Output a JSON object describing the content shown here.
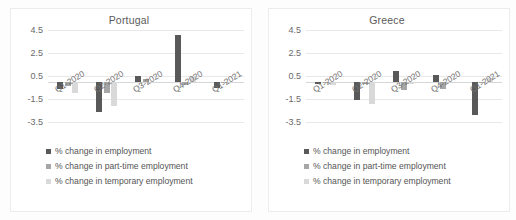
{
  "chart_data": [
    {
      "type": "bar",
      "title": "Portugal",
      "xlabel": "",
      "ylabel": "",
      "ylim": [
        -3.5,
        4.5
      ],
      "yticks": [
        4.5,
        2.5,
        0.5,
        -1.5,
        -3.5
      ],
      "ytick_labels": [
        "4.5",
        "2.5",
        "0.5",
        "-1.5",
        "-3.5"
      ],
      "grid": true,
      "legend_position": "below",
      "categories": [
        "Q1-2020",
        "Q2-2020",
        "Q3-2020",
        "Q4-2020",
        "Q1-2021"
      ],
      "series": [
        {
          "name": "% change in employment",
          "color": "#595959",
          "values": [
            -0.6,
            -2.6,
            0.5,
            4.1,
            -0.5
          ]
        },
        {
          "name": "% change in part-time employment",
          "color": "#a6a6a6",
          "values": [
            -0.4,
            -1.0,
            0.2,
            -0.3,
            -0.05
          ]
        },
        {
          "name": "% change in temporary employment",
          "color": "#d9d9d9",
          "values": [
            -1.0,
            -2.1,
            -0.05,
            0.5,
            0.0
          ]
        }
      ]
    },
    {
      "type": "bar",
      "title": "Greece",
      "xlabel": "",
      "ylabel": "",
      "ylim": [
        -3.5,
        4.5
      ],
      "yticks": [
        4.5,
        2.5,
        0.5,
        -1.5,
        -3.5
      ],
      "ytick_labels": [
        "4.5",
        "2.5",
        "0.5",
        "-1.5",
        "-3.5"
      ],
      "grid": true,
      "legend_position": "below",
      "categories": [
        "Q1-2020",
        "Q2-2020",
        "Q3-2020",
        "Q4-2020",
        "Q1-2021"
      ],
      "series": [
        {
          "name": "% change in employment",
          "color": "#595959",
          "values": [
            -0.2,
            -1.6,
            0.9,
            0.55,
            -2.9
          ]
        },
        {
          "name": "% change in part-time employment",
          "color": "#a6a6a6",
          "values": [
            -0.15,
            -0.2,
            -0.7,
            -0.6,
            -0.15
          ]
        },
        {
          "name": "% change in temporary employment",
          "color": "#d9d9d9",
          "values": [
            -0.3,
            -1.9,
            -0.2,
            0.0,
            0.35
          ]
        }
      ]
    }
  ],
  "panels": [
    {
      "title": "Portugal",
      "yticks": [
        "4.5",
        "2.5",
        "0.5",
        "-1.5",
        "-3.5"
      ],
      "xticks": [
        "Q1-2020",
        "Q2-2020",
        "Q3-2020",
        "Q4-2020",
        "Q1-2021"
      ],
      "legend": [
        "% change in employment",
        "% change in part-time employment",
        "% change in temporary employment"
      ]
    },
    {
      "title": "Greece",
      "yticks": [
        "4.5",
        "2.5",
        "0.5",
        "-1.5",
        "-3.5"
      ],
      "xticks": [
        "Q1-2020",
        "Q2-2020",
        "Q3-2020",
        "Q4-2020",
        "Q1-2021"
      ],
      "legend": [
        "% change in employment",
        "% change in part-time employment",
        "% change in temporary employment"
      ]
    }
  ],
  "colors": {
    "series_employment": "#595959",
    "series_part_time": "#a6a6a6",
    "series_temporary": "#d9d9d9",
    "grid": "#e8e8e8",
    "text": "#5a5a5a",
    "background": "#ffffff"
  }
}
